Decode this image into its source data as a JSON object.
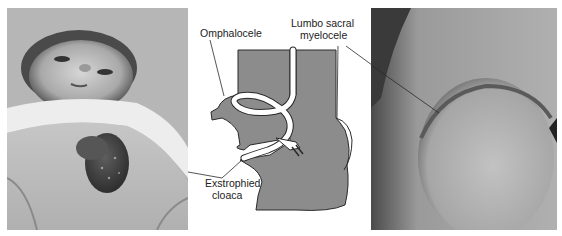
{
  "figure": {
    "panels": [
      {
        "id": "left",
        "type": "photograph",
        "subject": "infant-with-exstrophied-cloaca"
      },
      {
        "id": "center",
        "type": "schematic-diagram"
      },
      {
        "id": "right",
        "type": "photograph",
        "subject": "lumbosacral-myelocele-closeup"
      }
    ],
    "labels": {
      "omphalocele": "Omphalocele",
      "lumbosacral_line1": "Lumbo sacral",
      "lumbosacral_line2": "myelocele",
      "exstrophied_line1": "Exstrophied",
      "exstrophied_line2": "cloaca"
    },
    "colors": {
      "diagram_fill": "#8c8c8c",
      "outline": "#2a2a2a",
      "background": "#ffffff"
    }
  }
}
